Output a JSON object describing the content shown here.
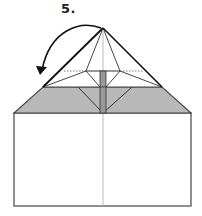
{
  "step": {
    "label": "5."
  },
  "colors": {
    "line": "#222222",
    "fold_band": "#b8b8b8",
    "center_strip": "#999999",
    "crease": "#bbbbbb",
    "paper": "#ffffff"
  },
  "figure": {
    "arrow": "curved-fold-arrow"
  }
}
